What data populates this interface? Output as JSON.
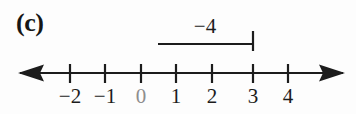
{
  "figure": {
    "part_label": "(c)",
    "background_color": "#fdfdfd",
    "ink_color": "#1c1c1c",
    "faint_ink_color": "#8e8e8e"
  },
  "vector": {
    "label": "−4",
    "label_center_x": 205,
    "label_y": 16,
    "start_x": 158,
    "end_x": 253,
    "line_y": 44,
    "cap_top_y": 31,
    "cap_bottom_y": 51,
    "start_value": 1,
    "end_value": 3,
    "magnitude": -4
  },
  "number_line": {
    "axis_y": 73,
    "left_arrow_x": 18,
    "right_arrow_x": 345,
    "tick_top_y": 64,
    "tick_bottom_y": 83,
    "origin_x": 141,
    "unit_px": 35.5,
    "ticks": [
      {
        "value": -2,
        "label": "−2",
        "x": 70,
        "faint": false
      },
      {
        "value": -1,
        "label": "−1",
        "x": 105,
        "faint": false
      },
      {
        "value": 0,
        "label": "0",
        "x": 141,
        "faint": true
      },
      {
        "value": 1,
        "label": "1",
        "x": 176,
        "faint": false
      },
      {
        "value": 2,
        "label": "2",
        "x": 212,
        "faint": false
      },
      {
        "value": 3,
        "label": "3",
        "x": 253,
        "faint": false
      },
      {
        "value": 4,
        "label": "4",
        "x": 288,
        "faint": false
      }
    ]
  },
  "chart_data": {
    "type": "line",
    "title": "(c)",
    "xlabel": "",
    "ylabel": "",
    "xlim": [
      -2.6,
      4.8
    ],
    "grid": false,
    "legend": null,
    "categories": [
      "-2",
      "-1",
      "0",
      "1",
      "2",
      "3",
      "4"
    ],
    "x": [
      -2,
      -1,
      0,
      1,
      2,
      3,
      4
    ],
    "values": [
      -2,
      -1,
      0,
      1,
      2,
      3,
      4
    ],
    "annotations": [
      {
        "text": "−4",
        "x_start": 1,
        "x_end": 3,
        "value": -4,
        "kind": "vector-bracket"
      }
    ]
  }
}
